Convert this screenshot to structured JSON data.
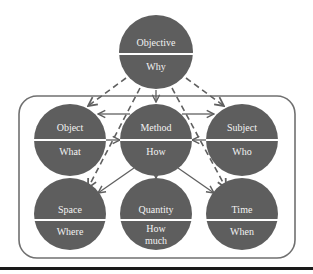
{
  "diagram": {
    "colors": {
      "node_fill": "#5e5e5e",
      "divider": "#ffffff",
      "arrow": "#606060",
      "frame": "#707070",
      "rule": "#1a1a1a",
      "text": "#f2f2f2"
    },
    "nodes": {
      "objective": {
        "top": "Objective",
        "bottom": "Why"
      },
      "object": {
        "top": "Object",
        "bottom": "What"
      },
      "method": {
        "top": "Method",
        "bottom": "How"
      },
      "subject": {
        "top": "Subject",
        "bottom": "Who"
      },
      "space": {
        "top": "Space",
        "bottom": "Where"
      },
      "quantity": {
        "top": "Quantity",
        "bottom_line1": "How",
        "bottom_line2": "much"
      },
      "time": {
        "top": "Time",
        "bottom": "When"
      }
    },
    "edges": [
      {
        "from": "Objective",
        "to": "Method",
        "style": "solid"
      },
      {
        "from": "Objective",
        "to": "Object",
        "style": "dashed"
      },
      {
        "from": "Objective",
        "to": "Subject",
        "style": "dashed"
      },
      {
        "from": "Objective",
        "to": "Space",
        "style": "dashed"
      },
      {
        "from": "Objective",
        "to": "Time",
        "style": "dashed"
      },
      {
        "from": "Method",
        "to": "Object",
        "style": "solid"
      },
      {
        "from": "Object",
        "to": "Method",
        "style": "solid"
      },
      {
        "from": "Method",
        "to": "Subject",
        "style": "solid"
      },
      {
        "from": "Subject",
        "to": "Method",
        "style": "solid"
      },
      {
        "from": "Method",
        "to": "Space",
        "style": "solid"
      },
      {
        "from": "Method",
        "to": "Quantity",
        "style": "solid"
      },
      {
        "from": "Method",
        "to": "Time",
        "style": "solid"
      }
    ]
  }
}
